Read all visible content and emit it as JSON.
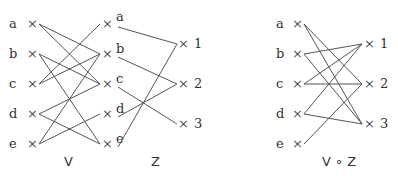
{
  "diagram": {
    "captions": {
      "v": "V",
      "z": "Z",
      "composite": "V ∘ Z"
    },
    "left_nodes": [
      "a",
      "b",
      "c",
      "d",
      "e"
    ],
    "middle_nodes": [
      "a",
      "b",
      "c",
      "d",
      "e"
    ],
    "right_nodes": [
      "1",
      "2",
      "3"
    ],
    "marker": "×",
    "V_edges": [
      [
        "a",
        "b"
      ],
      [
        "a",
        "c"
      ],
      [
        "b",
        "c"
      ],
      [
        "b",
        "e"
      ],
      [
        "c",
        "a"
      ],
      [
        "c",
        "b"
      ],
      [
        "d",
        "c"
      ],
      [
        "d",
        "e"
      ],
      [
        "e",
        "b"
      ],
      [
        "e",
        "d"
      ]
    ],
    "Z_edges": [
      [
        "a",
        "1"
      ],
      [
        "b",
        "2"
      ],
      [
        "c",
        "3"
      ],
      [
        "d",
        "2"
      ],
      [
        "e",
        "1"
      ]
    ],
    "VZ_edges": [
      [
        "a",
        "2"
      ],
      [
        "a",
        "3"
      ],
      [
        "b",
        "1"
      ],
      [
        "b",
        "3"
      ],
      [
        "c",
        "1"
      ],
      [
        "c",
        "2"
      ],
      [
        "d",
        "1"
      ],
      [
        "d",
        "3"
      ],
      [
        "e",
        "2"
      ]
    ],
    "colors": {
      "line": "#555555",
      "text": "#333333",
      "background": "#ffffff"
    }
  }
}
